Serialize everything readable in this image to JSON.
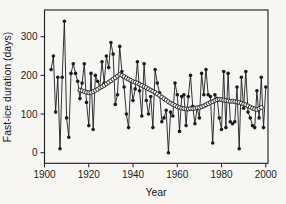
{
  "chart_data": {
    "type": "line",
    "title": "",
    "xlabel": "Year",
    "ylabel": "Fast-ice duration (days)",
    "xlim": [
      1900,
      2002
    ],
    "ylim": [
      -28,
      370
    ],
    "x_ticks": [
      1900,
      1920,
      1940,
      1960,
      1980,
      2000
    ],
    "y_ticks": [
      0,
      100,
      200,
      300
    ],
    "grid": false,
    "legend": "none",
    "ink_color": "#1c1c1c",
    "background_color": "#f7f6f3",
    "series": [
      {
        "name": "annual fast-ice duration",
        "marker": "filled-circle",
        "color": "#1c1c1c",
        "x_start": 1903,
        "x_step": 1,
        "values": [
          215,
          250,
          105,
          195,
          10,
          195,
          340,
          90,
          40,
          205,
          230,
          205,
          185,
          140,
          180,
          230,
          130,
          70,
          205,
          60,
          200,
          185,
          170,
          235,
          180,
          250,
          220,
          285,
          255,
          125,
          150,
          275,
          210,
          170,
          100,
          65,
          185,
          135,
          165,
          235,
          160,
          95,
          230,
          135,
          100,
          145,
          65,
          215,
          180,
          155,
          80,
          90,
          110,
          0,
          105,
          95,
          180,
          150,
          55,
          145,
          150,
          70,
          145,
          200,
          120,
          75,
          115,
          90,
          205,
          150,
          215,
          150,
          145,
          25,
          150,
          140,
          90,
          60,
          210,
          65,
          205,
          80,
          75,
          80,
          170,
          10,
          195,
          115,
          210,
          105,
          90,
          70,
          65,
          160,
          90,
          195,
          65,
          170
        ]
      },
      {
        "name": "smoothed running mean",
        "marker": "open-circle",
        "color": "#1c1c1c",
        "x_start": 1916,
        "x_step": 1,
        "values": [
          162,
          160,
          158,
          156,
          155,
          156,
          158,
          161,
          164,
          168,
          171,
          174,
          178,
          182,
          186,
          190,
          194,
          198,
          202,
          200,
          197,
          193,
          190,
          187,
          184,
          182,
          180,
          177,
          174,
          171,
          168,
          165,
          162,
          159,
          156,
          152,
          148,
          144,
          140,
          136,
          132,
          128,
          125,
          122,
          119,
          117,
          115,
          114,
          113,
          113,
          114,
          114,
          115,
          116,
          117,
          119,
          121,
          124,
          127,
          130,
          132,
          135,
          137,
          138,
          137,
          136,
          135,
          134,
          133,
          133,
          132,
          131,
          130,
          128,
          126,
          124,
          121,
          118,
          115,
          113,
          112,
          114,
          117
        ]
      }
    ]
  }
}
